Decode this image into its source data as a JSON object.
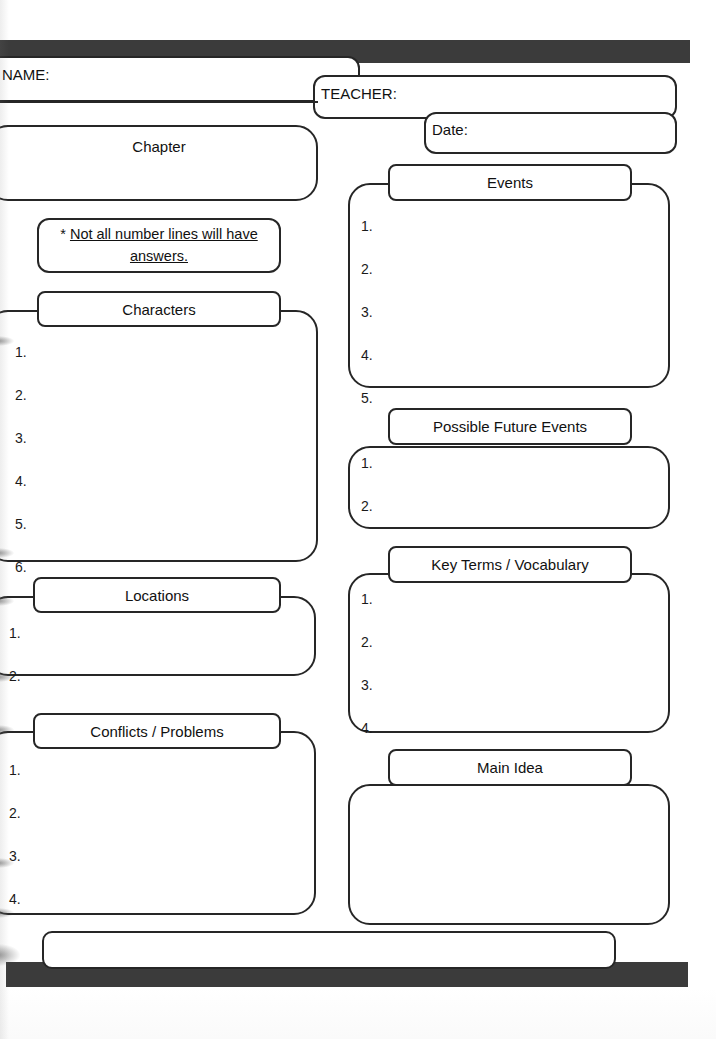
{
  "worksheet": {
    "title": "Chapter Notes Graphic Organizer",
    "ink_color": "#262626",
    "banner_color": "#3b3b3b",
    "paper_color": "#ffffff"
  },
  "header": {
    "name_label": "NAME:",
    "teacher_label": "TEACHER:",
    "date_label": "Date:"
  },
  "note": {
    "star": "* ",
    "line1": "Not all number lines will have",
    "line2": "answers."
  },
  "sections": {
    "chapter": {
      "title": "Chapter",
      "numbers": []
    },
    "characters": {
      "title": "Characters",
      "numbers": [
        "1.",
        "2.",
        "3.",
        "4.",
        "5.",
        "6."
      ]
    },
    "locations": {
      "title": "Locations",
      "numbers": [
        "1.",
        "2."
      ]
    },
    "conflicts": {
      "title": "Conflicts / Problems",
      "numbers": [
        "1.",
        "2.",
        "3.",
        "4."
      ]
    },
    "events": {
      "title": "Events",
      "numbers": [
        "1.",
        "2.",
        "3.",
        "4.",
        "5."
      ]
    },
    "future_events": {
      "title": "Possible Future Events",
      "numbers": [
        "1.",
        "2."
      ]
    },
    "key_terms": {
      "title": "Key Terms / Vocabulary",
      "numbers": [
        "1.",
        "2.",
        "3.",
        "4."
      ]
    },
    "main_idea": {
      "title": "Main Idea",
      "numbers": []
    },
    "footer": {
      "title": "",
      "numbers": []
    }
  }
}
